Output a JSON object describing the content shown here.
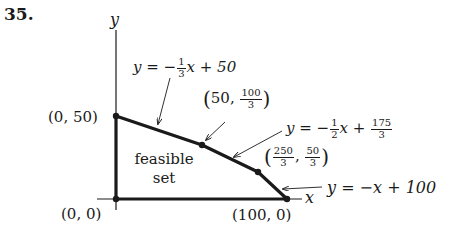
{
  "problem_number": "35.",
  "axes": {
    "x_label": "x",
    "y_label": "y"
  },
  "region_label": {
    "line1": "feasible",
    "line2": "set"
  },
  "vertices": [
    {
      "id": "origin",
      "label": "(0, 0)"
    },
    {
      "id": "y_intercept",
      "label": "(0, 50)"
    },
    {
      "id": "v1",
      "x_text": "50",
      "y_num": "100",
      "y_den": "3"
    },
    {
      "id": "v2",
      "x_num": "250",
      "x_den": "3",
      "y_num": "50",
      "y_den": "3"
    },
    {
      "id": "x_intercept",
      "label": "(100, 0)"
    }
  ],
  "constraints": [
    {
      "lhs": "y = −",
      "coef_num": "1",
      "coef_den": "3",
      "rest": "x + 50"
    },
    {
      "lhs": "y = −",
      "coef_num": "1",
      "coef_den": "2",
      "rest": "x + ",
      "const_num": "175",
      "const_den": "3"
    },
    {
      "text": "y = −x + 100"
    }
  ],
  "colors": {
    "ink": "#1a1a1a",
    "background": "#ffffff"
  }
}
